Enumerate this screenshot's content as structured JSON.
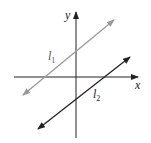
{
  "diagram": {
    "axes": {
      "x_label": "x",
      "y_label": "y"
    },
    "lines": [
      {
        "name": "l1",
        "label": "l",
        "subscript": "1",
        "color": "#999999"
      },
      {
        "name": "l2",
        "label": "l",
        "subscript": "2",
        "color": "#222222"
      }
    ]
  }
}
